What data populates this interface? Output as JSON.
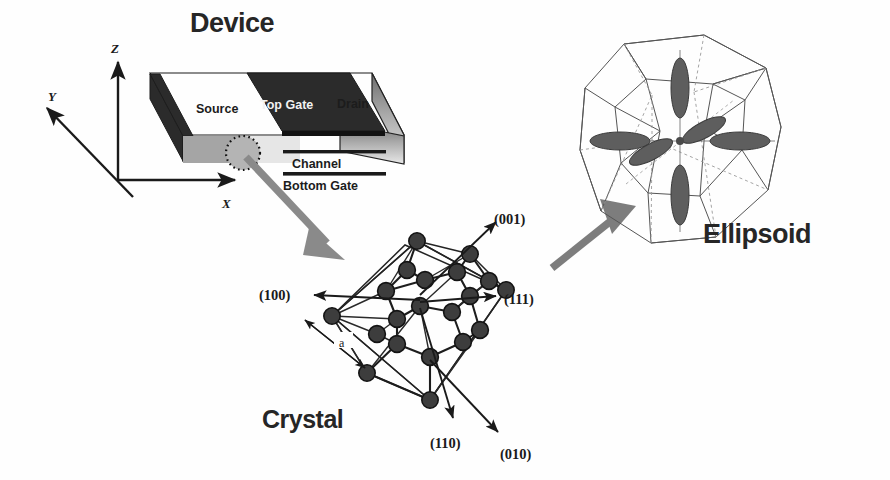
{
  "figure": {
    "kind": "scientific-diagram",
    "panels": [
      "Device",
      "Crystal",
      "Ellipsoid"
    ]
  },
  "titles": {
    "device": "Device",
    "crystal": "Crystal",
    "ellipsoid": "Ellipsoid"
  },
  "device": {
    "axes": {
      "x": "X",
      "y": "Y",
      "z": "Z"
    },
    "parts": {
      "source": "Source",
      "top_gate": "Top Gate",
      "drain": "Drain",
      "channel": "Channel",
      "bottom_gate": "Bottom Gate"
    }
  },
  "crystal": {
    "lattice_constant": "a",
    "directions": [
      {
        "index": "(100)",
        "label": "(100)"
      },
      {
        "index": "(001)",
        "label": "(001)"
      },
      {
        "index": "(111)",
        "label": "(111)"
      },
      {
        "index": "(110)",
        "label": "(110)"
      },
      {
        "index": "(010)",
        "label": "(010)"
      }
    ]
  },
  "ellipsoid": {
    "valley_count": 6,
    "zone": "truncated octahedron Brillouin zone"
  },
  "colors": {
    "ink": "#1a1a1a",
    "gate_fill": "#2b2b2b",
    "slab_edge": "#232323",
    "arrow_gray": "#8a8a8a",
    "arrow_gray_dark": "#6f6f6f",
    "valley_fill": "#5e5e5e",
    "bz_line": "#555555",
    "background": "#ffffff"
  }
}
